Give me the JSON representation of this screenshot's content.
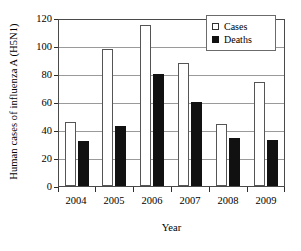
{
  "chart_data": {
    "type": "bar",
    "title": "",
    "xlabel": "Year",
    "ylabel": "Human cases of influenza A  (H5N1)",
    "categories": [
      "2004",
      "2005",
      "2006",
      "2007",
      "2008",
      "2009"
    ],
    "series": [
      {
        "name": "Cases",
        "values": [
          46,
          98,
          115,
          88,
          44,
          74
        ],
        "color": "#ffffff"
      },
      {
        "name": "Deaths",
        "values": [
          32,
          43,
          80,
          60,
          34,
          33
        ],
        "color": "#111111"
      }
    ],
    "ylim": [
      0,
      120
    ],
    "yticks": [
      120,
      100,
      80,
      60,
      40,
      20,
      0
    ],
    "ytick_labels": [
      "120",
      "100",
      "80",
      "60",
      "40",
      "20",
      "0"
    ],
    "grid": true,
    "grid_axis": "y",
    "legend_position": "top-right"
  },
  "legend": {
    "items": [
      {
        "label": "Cases",
        "swatch": "open-square-icon"
      },
      {
        "label": "Deaths",
        "swatch": "filled-square-icon"
      }
    ]
  }
}
